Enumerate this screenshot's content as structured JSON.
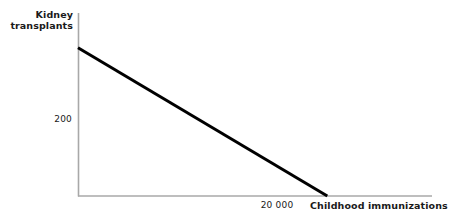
{
  "chart_data": {
    "type": "line",
    "title": "",
    "subtitle": "",
    "xlabel": "Childhood immunizations",
    "ylabel_lines": [
      "Kidney",
      "transplants"
    ],
    "ylabel": "Kidney transplants",
    "x_tick_labels": [
      "20 000"
    ],
    "y_tick_labels": [
      "200"
    ],
    "x_tick_values": [
      20000
    ],
    "y_tick_values": [
      200
    ],
    "xlim": [
      0,
      28400
    ],
    "ylim": [
      0,
      247
    ],
    "grid": false,
    "legend": null,
    "series": [
      {
        "name": "Production possibilities frontier",
        "x": [
          0,
          20000
        ],
        "y": [
          200,
          0
        ],
        "color": "#000000",
        "linewidth": 3
      }
    ],
    "annotations": [],
    "colors": {
      "line": "#000000",
      "axis": "#a8a8a8",
      "text": "#1a1a1a",
      "background": "#ffffff"
    }
  }
}
